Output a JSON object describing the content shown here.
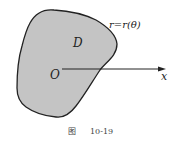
{
  "figure": {
    "region_label": "D",
    "origin_label": "O",
    "axis_label": "x",
    "curve_label": "r=r(θ)",
    "caption_prefix": "图",
    "caption_number": "10-19",
    "colors": {
      "region_fill": "#c4c4c4",
      "outline": "#222222",
      "axis": "#222222"
    }
  }
}
